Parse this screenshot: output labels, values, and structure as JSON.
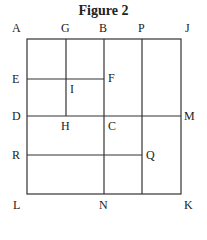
{
  "figure": {
    "title": "Figure 2",
    "labels": {
      "A": "A",
      "G": "G",
      "B": "B",
      "P": "P",
      "J": "J",
      "E": "E",
      "F": "F",
      "I": "I",
      "D": "D",
      "H": "H",
      "C": "C",
      "M": "M",
      "R": "R",
      "Q": "Q",
      "L": "L",
      "N": "N",
      "K": "K"
    },
    "line_color": "#333333"
  }
}
